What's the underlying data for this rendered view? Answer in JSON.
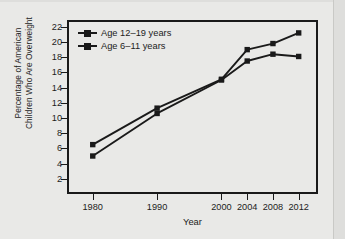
{
  "figure": {
    "background_color": "#e9e9e7",
    "ink_color": "#1a1a1a",
    "x_axis_title": "Year"
  },
  "y_axis_title_line1": "Percentage of American",
  "y_axis_title_line2": "Children Who Are Overweight",
  "chart_data": {
    "type": "line",
    "title": "",
    "subtitle": "",
    "xlabel": "Year",
    "ylabel": "Percentage of American Children Who Are Overweight",
    "x": [
      1980,
      1990,
      2000,
      2004,
      2008,
      2012
    ],
    "categories": [
      "1980",
      "1990",
      "2000",
      "2004",
      "2008",
      "2012"
    ],
    "xlim": [
      1976,
      2015
    ],
    "ylim": [
      0,
      22.9
    ],
    "xticks": [
      1980,
      1990,
      2000,
      2004,
      2008,
      2012
    ],
    "xtick_labels": [
      "1980",
      "1990",
      "2000",
      "2004",
      "2008",
      "2012"
    ],
    "yticks": [
      2,
      4,
      6,
      8,
      10,
      12,
      14,
      16,
      18,
      20,
      22
    ],
    "ytick_labels": [
      "2",
      "4",
      "6",
      "8",
      "10",
      "12",
      "14",
      "16",
      "18",
      "20",
      "22"
    ],
    "grid": false,
    "legend_position": "upper left",
    "marker": "square",
    "series": [
      {
        "name": "Age 12–19 years",
        "color": "#1a1a1a",
        "values": [
          6.5,
          11.3,
          15.1,
          19.0,
          19.8,
          21.2
        ]
      },
      {
        "name": "Age 6–11 years",
        "color": "#1a1a1a",
        "values": [
          5.0,
          10.6,
          15.0,
          17.5,
          18.4,
          18.1
        ]
      }
    ]
  },
  "legend": {
    "items": [
      {
        "label": "Age 12–19 years"
      },
      {
        "label": "Age 6–11 years"
      }
    ]
  }
}
